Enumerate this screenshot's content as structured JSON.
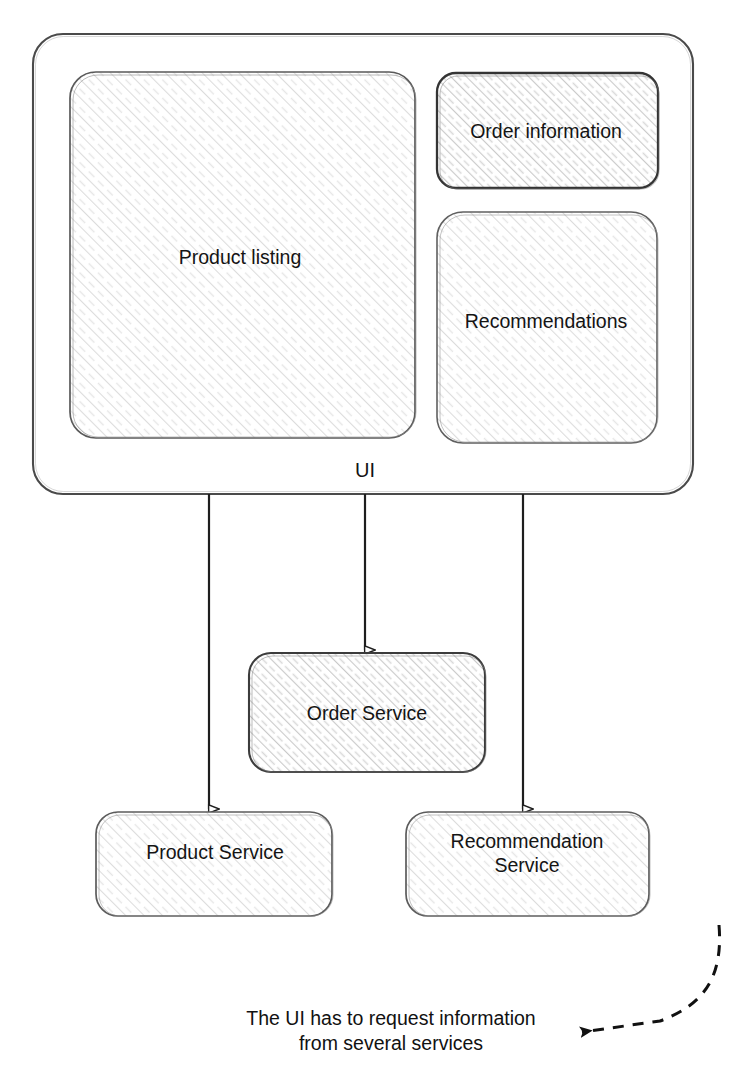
{
  "diagram": {
    "colors": {
      "stroke": "#3a3a3a",
      "outer_stroke": "#4a4a4a",
      "hatch_light": "#d8d8d8",
      "hatch_medium": "#c4c4c4",
      "text": "#141414",
      "background": "#ffffff"
    },
    "container": {
      "name": "UI",
      "label": "UI",
      "panels": [
        {
          "id": "product-listing",
          "label": "Product listing"
        },
        {
          "id": "order-information",
          "label": "Order information"
        },
        {
          "id": "recommendations",
          "label": "Recommendations"
        }
      ]
    },
    "services": [
      {
        "id": "order-service",
        "label": "Order Service"
      },
      {
        "id": "product-service",
        "label": "Product Service"
      },
      {
        "id": "recommendation-service",
        "label": "Recommendation\nService"
      }
    ],
    "connections": [
      {
        "from": "UI",
        "to": "Product Service",
        "style": "solid-hollow-arrow"
      },
      {
        "from": "UI",
        "to": "Order Service",
        "style": "solid-hollow-arrow"
      },
      {
        "from": "UI",
        "to": "Recommendation Service",
        "style": "solid-hollow-arrow"
      }
    ],
    "annotation": {
      "text": "The UI has to request information\nfrom several services",
      "pointer": "dashed-curved-arrow"
    }
  }
}
